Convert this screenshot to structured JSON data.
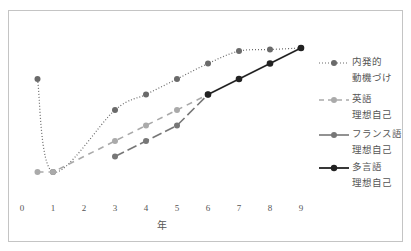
{
  "chart_data": {
    "type": "line",
    "title": "",
    "xlabel": "年",
    "ylabel": "",
    "x_ticks": [
      "0",
      "1",
      "2",
      "3",
      "4",
      "5",
      "6",
      "7",
      "8",
      "9"
    ],
    "xlim": [
      0,
      9
    ],
    "ylim": [
      0,
      10
    ],
    "grid": false,
    "legend_position": "right",
    "series": [
      {
        "name": "内発的動機づけ",
        "label_lines": [
          "内発的",
          "動機づけ"
        ],
        "style": "dotted",
        "color": "#6a6a6a",
        "points": [
          [
            0.5,
            7
          ],
          [
            1,
            1
          ],
          [
            3,
            5
          ],
          [
            4,
            6
          ],
          [
            5,
            7
          ],
          [
            6,
            8
          ],
          [
            7,
            8.8
          ],
          [
            8,
            8.9
          ],
          [
            9,
            9
          ]
        ]
      },
      {
        "name": "英語理想自己",
        "label_lines": [
          "英語",
          "理想自己"
        ],
        "style": "dashed",
        "color": "#aaaaaa",
        "points": [
          [
            0.5,
            1
          ],
          [
            1,
            1
          ],
          [
            3,
            3
          ],
          [
            4,
            4
          ],
          [
            5,
            5
          ],
          [
            6,
            6
          ]
        ]
      },
      {
        "name": "フランス語理想自己",
        "label_lines": [
          "フランス語",
          "理想自己"
        ],
        "style": "long-dash",
        "color": "#777777",
        "points": [
          [
            3,
            2
          ],
          [
            4,
            3
          ],
          [
            5,
            4
          ],
          [
            6,
            6
          ]
        ]
      },
      {
        "name": "多言語理想自己",
        "label_lines": [
          "多言語",
          "理想自己"
        ],
        "style": "solid",
        "color": "#222222",
        "points": [
          [
            6,
            6
          ],
          [
            7,
            7
          ],
          [
            8,
            8
          ],
          [
            9,
            9
          ]
        ]
      }
    ]
  }
}
